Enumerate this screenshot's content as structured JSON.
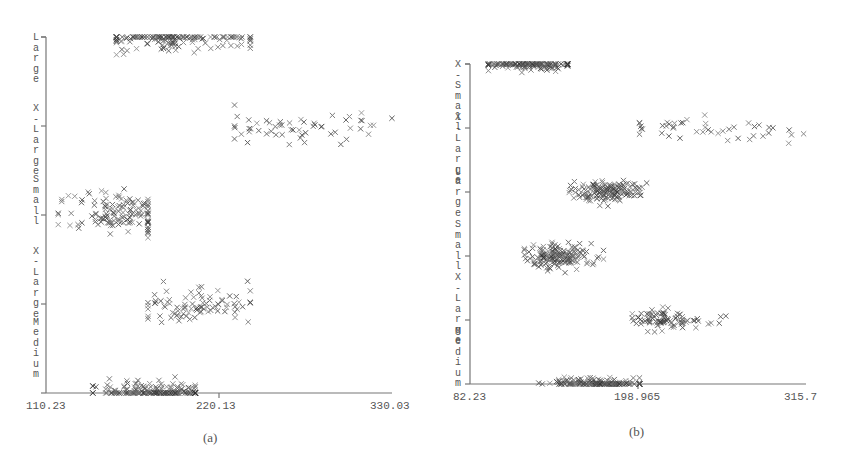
{
  "chart_data": [
    {
      "type": "scatter",
      "title": "",
      "caption": "(a)",
      "marker": "x",
      "xlabel": "",
      "ylabel": "",
      "xlim": [
        110.23,
        330.03
      ],
      "x_ticks": [
        "110.23",
        "220.13",
        "330.03"
      ],
      "y_categories": [
        "Medium",
        "X-Large",
        "Small",
        "Large",
        "X-Large"
      ],
      "y_axis_text": [
        "L a r g e",
        "X - L a r g e",
        "S m a l l",
        "X - L a r g e",
        "M e d i u m"
      ],
      "grid": false,
      "clusters": [
        {
          "category": "Large",
          "y_level": 4,
          "x_center": 193,
          "x_spread": 28,
          "y_spread": 0.07,
          "n": 150,
          "x_min": 155,
          "x_max": 240
        },
        {
          "category": "X-Large",
          "y_level": 3,
          "x_center": 275,
          "x_spread": 30,
          "y_spread": 0.09,
          "n": 55,
          "x_min": 230,
          "x_max": 330
        },
        {
          "category": "Small",
          "y_level": 2,
          "x_center": 158,
          "x_spread": 18,
          "y_spread": 0.12,
          "n": 130,
          "x_min": 118,
          "x_max": 175
        },
        {
          "category": "X-Large",
          "y_level": 1,
          "x_center": 205,
          "x_spread": 18,
          "y_spread": 0.1,
          "n": 90,
          "x_min": 175,
          "x_max": 240
        },
        {
          "category": "Medium",
          "y_level": 0,
          "x_center": 177,
          "x_spread": 18,
          "y_spread": 0.07,
          "n": 180,
          "x_min": 140,
          "x_max": 205
        }
      ]
    },
    {
      "type": "scatter",
      "title": "",
      "caption": "(b)",
      "marker": "x",
      "xlabel": "",
      "ylabel": "",
      "xlim": [
        82.23,
        315.7
      ],
      "x_ticks": [
        "82.23",
        "198.965",
        "315.7"
      ],
      "y_categories": [
        "Medium",
        "X-Large",
        "Small",
        "Large",
        "X-Large",
        "Small"
      ],
      "y_axis_text": [
        "X - S m a l l",
        "X - L a r g e",
        "L a r g e",
        "S m a l l",
        "X - L a r g e",
        "M e d i u m"
      ],
      "grid": false,
      "clusters": [
        {
          "category": "Small",
          "y_level": 5,
          "x_center": 125,
          "x_spread": 17,
          "y_spread": 0.05,
          "n": 150,
          "x_min": 95,
          "x_max": 150
        },
        {
          "category": "X-Large",
          "y_level": 4,
          "x_center": 245,
          "x_spread": 35,
          "y_spread": 0.1,
          "n": 45,
          "x_min": 200,
          "x_max": 315
        },
        {
          "category": "Large",
          "y_level": 3,
          "x_center": 178,
          "x_spread": 12,
          "y_spread": 0.08,
          "n": 150,
          "x_min": 150,
          "x_max": 205
        },
        {
          "category": "Small",
          "y_level": 2,
          "x_center": 145,
          "x_spread": 12,
          "y_spread": 0.09,
          "n": 170,
          "x_min": 120,
          "x_max": 175
        },
        {
          "category": "X-Large",
          "y_level": 1,
          "x_center": 218,
          "x_spread": 14,
          "y_spread": 0.07,
          "n": 90,
          "x_min": 195,
          "x_max": 315
        },
        {
          "category": "Medium",
          "y_level": 0,
          "x_center": 170,
          "x_spread": 15,
          "y_spread": 0.05,
          "n": 160,
          "x_min": 130,
          "x_max": 200
        }
      ]
    }
  ],
  "panels": {
    "a": {
      "caption": "(a)",
      "tick_left": "110.23",
      "tick_mid": "220.13",
      "tick_right": "330.03"
    },
    "b": {
      "caption": "(b)",
      "tick_left": "82.23",
      "tick_mid": "198.965",
      "tick_right": "315.7"
    }
  }
}
